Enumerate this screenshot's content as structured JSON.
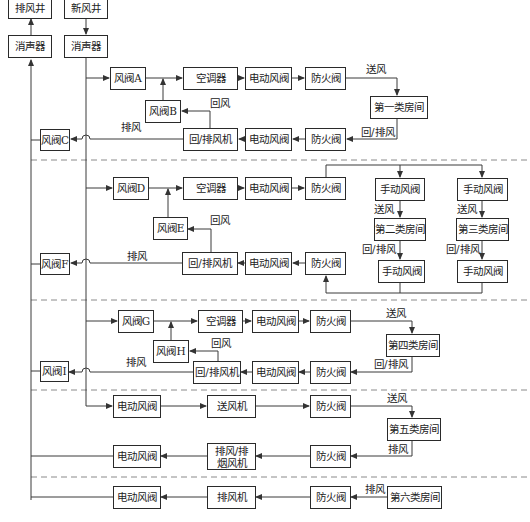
{
  "diagram": {
    "type": "HVAC air-flow schematic",
    "shafts": {
      "exhaust_shaft": "排风井",
      "fresh_air_shaft": "新风井",
      "silencer_left": "消声器",
      "silencer_right": "消声器"
    },
    "section1": {
      "damper_a": "风阀A",
      "ahu": "空调器",
      "motor_damper_supply": "电动风阀",
      "fire_damper_supply": "防火阀",
      "room": "第一类房间",
      "supply_label": "送风",
      "return_label": "回/排风",
      "fire_damper_return": "防火阀",
      "motor_damper_return": "电动风阀",
      "return_fan": "回/排风机",
      "damper_b": "风阀B",
      "return_air_label": "回风",
      "exhaust_label": "排风",
      "damper_c": "风阀C"
    },
    "section2": {
      "damper_d": "风阀D",
      "ahu": "空调器",
      "motor_damper_supply": "电动风阀",
      "fire_damper_supply": "防火阀",
      "manual_damper_1_top": "手动风阀",
      "manual_damper_2_top": "手动风阀",
      "supply_label_1": "送风",
      "supply_label_2": "送风",
      "room_2": "第二类房间",
      "room_3": "第三类房间",
      "return_label_1": "回/排风",
      "return_label_2": "回/排风",
      "manual_damper_1_bottom": "手动风阀",
      "manual_damper_2_bottom": "手动风阀",
      "fire_damper_return": "防火阀",
      "motor_damper_return": "电动风阀",
      "return_fan": "回/排风机",
      "damper_e": "风阀E",
      "return_air_label": "回风",
      "exhaust_label": "排风",
      "damper_f": "风阀F"
    },
    "section3": {
      "damper_g": "风阀G",
      "ahu": "空调器",
      "motor_damper_supply": "电动风阀",
      "fire_damper_supply": "防火阀",
      "supply_label": "送风",
      "room": "第四类房间",
      "return_label": "回/排风",
      "fire_damper_return": "防火阀",
      "motor_damper_return": "电动风阀",
      "return_fan": "回/排风机",
      "damper_h": "风阀H",
      "return_air_label": "回风",
      "exhaust_label": "排风",
      "damper_i": "风阀I"
    },
    "section4": {
      "motor_damper_supply": "电动风阀",
      "supply_fan": "送风机",
      "fire_damper_supply": "防火阀",
      "supply_label": "送风",
      "room": "第五类房间",
      "exhaust_label": "排风",
      "fire_damper_exhaust": "防火阀",
      "smoke_fan": "排风/排烟风机",
      "motor_damper_exhaust": "电动风阀"
    },
    "section5": {
      "room": "第六类房间",
      "exhaust_label": "排风",
      "fire_damper": "防火阀",
      "exhaust_fan": "排风机",
      "motor_damper": "电动风阀"
    }
  },
  "colors": {
    "line": "#3a3a3a",
    "dashed": "#8a8a8a",
    "box_border": "#2a2a2a",
    "background": "#ffffff"
  }
}
